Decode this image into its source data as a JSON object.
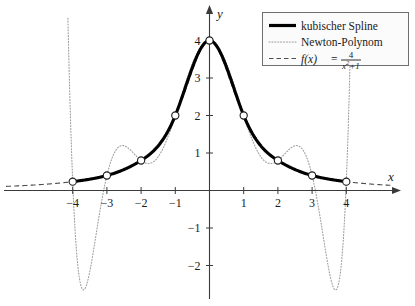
{
  "chart_data": {
    "type": "line",
    "title": "",
    "xlabel": "x",
    "ylabel": "y",
    "xlim": [
      -4.75,
      5.0
    ],
    "ylim": [
      -2.9,
      4.55
    ],
    "xticks": [
      -4,
      -3,
      -2,
      -1,
      1,
      2,
      3,
      4
    ],
    "xtick_labels": [
      "−4",
      "−3",
      "−2",
      "−1",
      "1",
      "2",
      "3",
      "4"
    ],
    "yticks": [
      1,
      2,
      3,
      4,
      -1,
      -2
    ],
    "ytick_labels": [
      "1",
      "2",
      "3",
      "4",
      "−1",
      "−2"
    ],
    "grid": false,
    "legend_position": "top-right",
    "nodes": {
      "x": [
        -4,
        -3,
        -2,
        -1,
        0,
        1,
        2,
        3,
        4
      ],
      "y": [
        0.2353,
        0.4,
        0.8,
        2.0,
        4.0,
        2.0,
        0.8,
        0.4,
        0.2353
      ],
      "marker": "open-circle"
    },
    "series": [
      {
        "name": "kubischer Spline",
        "style": "solid-thick",
        "color": "#000000",
        "x": [
          -4,
          -3.75,
          -3.5,
          -3.25,
          -3,
          -2.75,
          -2.5,
          -2.25,
          -2,
          -1.75,
          -1.5,
          -1.25,
          -1,
          -0.75,
          -0.5,
          -0.25,
          0,
          0.25,
          0.5,
          0.75,
          1,
          1.25,
          1.5,
          1.75,
          2,
          2.25,
          2.5,
          2.75,
          3,
          3.25,
          3.5,
          3.75,
          4
        ],
        "y": [
          0.2353,
          0.2631,
          0.3015,
          0.3459,
          0.4,
          0.4601,
          0.5355,
          0.6373,
          0.8,
          1.0064,
          1.2689,
          1.5801,
          2.0,
          2.4987,
          3.0485,
          3.5847,
          4.0,
          3.5847,
          3.0485,
          2.4987,
          2.0,
          1.5801,
          1.2689,
          1.0064,
          0.8,
          0.6373,
          0.5355,
          0.4601,
          0.4,
          0.3459,
          0.3015,
          0.2631,
          0.2353
        ]
      },
      {
        "name": "Newton-Polynom",
        "style": "dotted",
        "color": "#9a9a9a",
        "note": "degree-8 interpolating polynomial through the 9 equidistant nodes; exhibits Runge oscillation with minima near x=±3.6 (y≈−2.6) and maxima near x=±2.5 (y≈1.3)"
      },
      {
        "name": "f(x) = 4/(x^2+1)",
        "style": "dashed",
        "color": "#555555",
        "formula_lhs": "f(x)",
        "formula_eq": "=",
        "formula_numerator": "4",
        "formula_denominator_base": "x",
        "formula_denominator_exp": "2",
        "formula_denominator_tail": "+1"
      }
    ]
  },
  "legend": {
    "items": [
      {
        "label": "kubischer Spline",
        "style": "solid-thick"
      },
      {
        "label": "Newton-Polynom",
        "style": "dotted"
      },
      {
        "label": "",
        "style": "dashed"
      }
    ]
  },
  "axes": {
    "x_axis_name": "x",
    "y_axis_name": "y"
  }
}
